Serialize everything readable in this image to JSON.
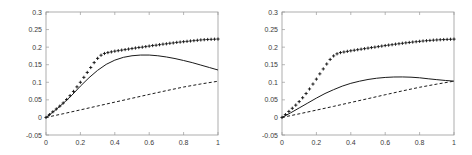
{
  "figure": {
    "panel_count": 2,
    "background": "#ffffff",
    "ink": "#1a1a1a",
    "axis_color": "#9a9a9a"
  },
  "chart_data": [
    {
      "type": "line",
      "panel": "left",
      "title": "",
      "xlabel": "",
      "ylabel": "",
      "xlim": [
        0,
        1
      ],
      "ylim": [
        -0.05,
        0.3
      ],
      "xticks": [
        0,
        0.2,
        0.4,
        0.6,
        0.8,
        1
      ],
      "xticklabels": [
        "0",
        "0.2",
        "0.4",
        "0.6",
        "0.8",
        "1"
      ],
      "yticks": [
        -0.05,
        0,
        0.05,
        0.1,
        0.15,
        0.2,
        0.25,
        0.3
      ],
      "yticklabels": [
        "-0.05",
        "0",
        "0.05",
        "0.1",
        "0.15",
        "0.2",
        "0.25",
        "0.3"
      ],
      "grid": false,
      "legend": null,
      "series": [
        {
          "name": "marker-series",
          "style": "plus-markers",
          "marker": "+",
          "linestyle": "none",
          "x": [
            0,
            0.02,
            0.04,
            0.06,
            0.08,
            0.1,
            0.12,
            0.14,
            0.16,
            0.18,
            0.2,
            0.22,
            0.24,
            0.26,
            0.28,
            0.3,
            0.32,
            0.34,
            0.36,
            0.38,
            0.4,
            0.42,
            0.44,
            0.46,
            0.48,
            0.5,
            0.52,
            0.54,
            0.56,
            0.58,
            0.6,
            0.62,
            0.64,
            0.66,
            0.68,
            0.7,
            0.72,
            0.74,
            0.76,
            0.78,
            0.8,
            0.82,
            0.84,
            0.86,
            0.88,
            0.9,
            0.92,
            0.94,
            0.96,
            0.98,
            1
          ],
          "y": [
            0,
            0.008,
            0.016,
            0.024,
            0.032,
            0.041,
            0.051,
            0.062,
            0.074,
            0.087,
            0.1,
            0.114,
            0.128,
            0.142,
            0.156,
            0.168,
            0.177,
            0.182,
            0.1845,
            0.1865,
            0.1885,
            0.19,
            0.1915,
            0.193,
            0.1945,
            0.196,
            0.1975,
            0.199,
            0.2,
            0.2015,
            0.203,
            0.2045,
            0.2055,
            0.207,
            0.2085,
            0.2095,
            0.211,
            0.212,
            0.2135,
            0.2145,
            0.2155,
            0.2165,
            0.2175,
            0.2185,
            0.2195,
            0.2205,
            0.2212,
            0.2218,
            0.2222,
            0.2226,
            0.223
          ]
        },
        {
          "name": "solid-series",
          "style": "solid-line",
          "linestyle": "-",
          "x": [
            0,
            0.05,
            0.1,
            0.15,
            0.2,
            0.25,
            0.3,
            0.35,
            0.4,
            0.45,
            0.5,
            0.55,
            0.6,
            0.65,
            0.7,
            0.75,
            0.8,
            0.85,
            0.9,
            0.95,
            1
          ],
          "y": [
            0,
            0.019,
            0.04,
            0.063,
            0.089,
            0.113,
            0.134,
            0.151,
            0.163,
            0.171,
            0.1755,
            0.1775,
            0.1775,
            0.1755,
            0.172,
            0.1675,
            0.162,
            0.156,
            0.149,
            0.142,
            0.135
          ]
        },
        {
          "name": "dashed-series",
          "style": "dashed-line",
          "linestyle": "--",
          "x": [
            0,
            0.1,
            0.2,
            0.3,
            0.4,
            0.5,
            0.6,
            0.7,
            0.8,
            0.9,
            1
          ],
          "y": [
            0,
            0.0105,
            0.0215,
            0.0325,
            0.0435,
            0.0545,
            0.0655,
            0.0762,
            0.0865,
            0.0952,
            0.103
          ]
        }
      ]
    },
    {
      "type": "line",
      "panel": "right",
      "title": "",
      "xlabel": "",
      "ylabel": "",
      "xlim": [
        0,
        1
      ],
      "ylim": [
        -0.05,
        0.3
      ],
      "xticks": [
        0,
        0.2,
        0.4,
        0.6,
        0.8,
        1
      ],
      "xticklabels": [
        "0",
        "0.2",
        "0.4",
        "0.6",
        "0.8",
        "1"
      ],
      "yticks": [
        -0.05,
        0,
        0.05,
        0.1,
        0.15,
        0.2,
        0.25,
        0.3
      ],
      "yticklabels": [
        "-0.05",
        "0",
        "0.05",
        "0.1",
        "0.15",
        "0.2",
        "0.25",
        "0.3"
      ],
      "grid": false,
      "legend": null,
      "series": [
        {
          "name": "marker-series",
          "style": "plus-markers",
          "marker": "+",
          "linestyle": "none",
          "x": [
            0,
            0.02,
            0.04,
            0.06,
            0.08,
            0.1,
            0.12,
            0.14,
            0.16,
            0.18,
            0.2,
            0.22,
            0.24,
            0.26,
            0.28,
            0.3,
            0.32,
            0.34,
            0.36,
            0.38,
            0.4,
            0.42,
            0.44,
            0.46,
            0.48,
            0.5,
            0.52,
            0.54,
            0.56,
            0.58,
            0.6,
            0.62,
            0.64,
            0.66,
            0.68,
            0.7,
            0.72,
            0.74,
            0.76,
            0.78,
            0.8,
            0.82,
            0.84,
            0.86,
            0.88,
            0.9,
            0.92,
            0.94,
            0.96,
            0.98,
            1
          ],
          "y": [
            0,
            0.008,
            0.017,
            0.026,
            0.035,
            0.045,
            0.056,
            0.068,
            0.081,
            0.095,
            0.109,
            0.124,
            0.138,
            0.152,
            0.165,
            0.175,
            0.181,
            0.1845,
            0.1862,
            0.188,
            0.1897,
            0.1912,
            0.1927,
            0.1942,
            0.1957,
            0.1972,
            0.1987,
            0.2,
            0.2015,
            0.203,
            0.2045,
            0.2058,
            0.207,
            0.2085,
            0.2097,
            0.211,
            0.2122,
            0.2133,
            0.2145,
            0.2155,
            0.2165,
            0.2175,
            0.2183,
            0.2191,
            0.2199,
            0.2205,
            0.2211,
            0.2216,
            0.222,
            0.2224,
            0.2228
          ]
        },
        {
          "name": "solid-series",
          "style": "solid-line",
          "linestyle": "-",
          "x": [
            0,
            0.05,
            0.1,
            0.15,
            0.2,
            0.25,
            0.3,
            0.35,
            0.4,
            0.45,
            0.5,
            0.55,
            0.6,
            0.65,
            0.7,
            0.75,
            0.8,
            0.85,
            0.9,
            0.95,
            1
          ],
          "y": [
            0,
            0.013,
            0.027,
            0.041,
            0.055,
            0.068,
            0.079,
            0.089,
            0.097,
            0.103,
            0.108,
            0.1115,
            0.1138,
            0.115,
            0.1152,
            0.1145,
            0.1128,
            0.11,
            0.1075,
            0.1052,
            0.1032
          ]
        },
        {
          "name": "dashed-series",
          "style": "dashed-line",
          "linestyle": "--",
          "x": [
            0,
            0.1,
            0.2,
            0.3,
            0.4,
            0.5,
            0.6,
            0.7,
            0.8,
            0.9,
            1
          ],
          "y": [
            0,
            0.0102,
            0.0208,
            0.0315,
            0.0425,
            0.0535,
            0.0645,
            0.0755,
            0.0858,
            0.0948,
            0.1032
          ]
        }
      ]
    }
  ]
}
